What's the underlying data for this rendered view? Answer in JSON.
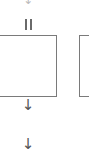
{
  "diagram": {
    "top_connector": {
      "icon": "arrow-down-icon",
      "glyph": "↓"
    },
    "link_marker": {
      "icon": "parallel-lines-icon",
      "glyph": "II"
    },
    "nodes": [
      {
        "id": "node-1",
        "label": ""
      },
      {
        "id": "node-2",
        "label": ""
      }
    ],
    "connectors": [
      {
        "icon": "arrow-down-icon",
        "glyph": "↓"
      },
      {
        "icon": "arrow-down-icon",
        "glyph": "↓"
      }
    ],
    "colors": {
      "border": "#7a7a7a",
      "arrow": "#555555",
      "background": "#ffffff"
    }
  }
}
